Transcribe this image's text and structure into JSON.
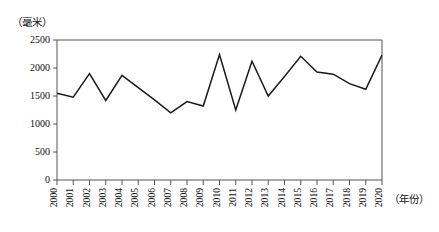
{
  "chart_data": {
    "type": "line",
    "title": "",
    "xlabel": "（年份）",
    "ylabel": "（毫米）",
    "x": [
      2000,
      2001,
      2002,
      2003,
      2004,
      2005,
      2006,
      2007,
      2008,
      2009,
      2010,
      2011,
      2012,
      2013,
      2014,
      2015,
      2016,
      2017,
      2018,
      2019,
      2020
    ],
    "values": [
      1550,
      1480,
      1900,
      1420,
      1870,
      1650,
      1430,
      1200,
      1400,
      1320,
      2240,
      1250,
      2120,
      1500,
      1850,
      2210,
      1930,
      1890,
      1720,
      1620,
      2230
    ],
    "categories": [
      "2000",
      "2001",
      "2002",
      "2003",
      "2004",
      "2005",
      "2006",
      "2007",
      "2008",
      "2009",
      "2010",
      "2011",
      "2012",
      "2013",
      "2014",
      "2015",
      "2016",
      "2017",
      "2018",
      "2019",
      "2020"
    ],
    "ylim": [
      0,
      2500
    ],
    "ytick_values": [
      0,
      500,
      1000,
      1500,
      2000,
      2500
    ],
    "ytick_labels": [
      "0",
      "500",
      "1000",
      "1500",
      "2000",
      "2500"
    ],
    "xlim": [
      2000,
      2020
    ],
    "grid": false,
    "legend": null,
    "series_name": "降水量",
    "line_color": "#1a1a1a",
    "axis_color": "#555555"
  }
}
